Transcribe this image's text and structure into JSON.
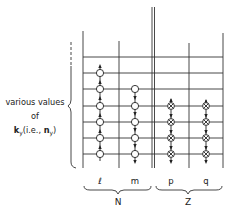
{
  "diagram": {
    "y_axis_label": {
      "line1": "various values",
      "line2": "of",
      "line3": "k_y (i.e., n_y)",
      "line3_k": "k",
      "line3_ksub": "y",
      "line3_mid": "(i.e., ",
      "line3_n": "n",
      "line3_nsub": "y",
      "line3_end": ")"
    },
    "columns": [
      {
        "label": "ℓ",
        "group": "N",
        "symbol": "open-circle",
        "levels": [
          1,
          2,
          3,
          4,
          5,
          6
        ]
      },
      {
        "label": "m",
        "group": "N",
        "symbol": "open-circle",
        "levels": [
          1,
          2,
          3,
          4,
          5
        ]
      },
      {
        "label": "p",
        "group": "Z",
        "symbol": "crossed-circle",
        "levels": [
          1,
          2,
          3,
          4
        ]
      },
      {
        "label": "q",
        "group": "Z",
        "symbol": "crossed-circle",
        "levels": [
          1,
          2,
          3,
          4
        ]
      }
    ],
    "groups": [
      {
        "label": "N",
        "columns": [
          "ℓ",
          "m"
        ]
      },
      {
        "label": "Z",
        "columns": [
          "p",
          "q"
        ]
      }
    ],
    "colors": {
      "line": "#333333",
      "text": "#222222",
      "background": "#ffffff"
    }
  }
}
